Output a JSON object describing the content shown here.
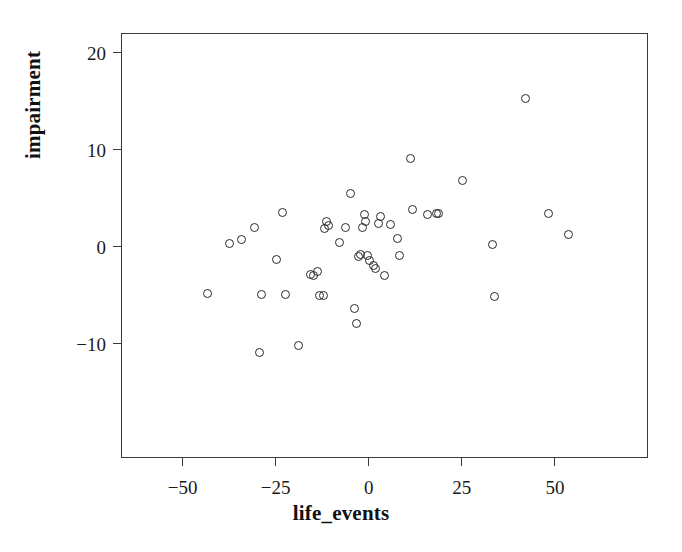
{
  "figure": {
    "background_color": "#ffffff",
    "frame_color": "#3a3a3a",
    "point_color": "#2a2a2a"
  },
  "chart_data": {
    "type": "scatter",
    "title": "",
    "xlabel": "life_events",
    "ylabel": "impairment",
    "xlim": [
      -66,
      75
    ],
    "ylim": [
      -21.7,
      21.8
    ],
    "xticks": [
      -50,
      -25,
      0,
      25,
      50
    ],
    "xtick_labels": [
      "−50",
      "−25",
      "0",
      "25",
      "50"
    ],
    "yticks": [
      -10,
      0,
      10,
      20
    ],
    "ytick_labels": [
      "−10",
      "0",
      "10",
      "20"
    ],
    "grid": false,
    "legend": null,
    "marker": "open-circle",
    "n_points": 48,
    "x": [
      -43.0,
      -37.0,
      -34.0,
      -30.5,
      -29.0,
      -28.5,
      -24.5,
      -23.0,
      -22.0,
      -18.5,
      -15.5,
      -14.5,
      -13.5,
      -13.0,
      -12.0,
      -11.5,
      -11.0,
      -10.5,
      -7.5,
      -6.0,
      -4.5,
      -3.5,
      -3.0,
      -2.5,
      -2.0,
      -1.5,
      -1.0,
      -0.5,
      0.0,
      0.5,
      1.5,
      2.0,
      3.0,
      3.5,
      4.5,
      6.0,
      8.0,
      8.5,
      11.5,
      12.0,
      16.0,
      18.5,
      19.0,
      25.5,
      33.5,
      34.0,
      48.5,
      42.5,
      54.0
    ],
    "y": [
      -4.9,
      0.3,
      0.7,
      1.9,
      -11.0,
      -5.0,
      -1.4,
      3.4,
      -5.0,
      -10.2,
      -2.9,
      -3.0,
      -2.6,
      -5.1,
      -5.1,
      1.8,
      2.5,
      2.1,
      0.4,
      1.9,
      5.4,
      -6.4,
      -8.0,
      -1.1,
      -0.9,
      1.9,
      3.2,
      2.5,
      -1.0,
      -1.5,
      -2.0,
      -2.3,
      2.3,
      3.0,
      -3.0,
      2.2,
      0.8,
      -1.0,
      9.0,
      3.8,
      3.2,
      3.3,
      3.3,
      6.7,
      0.2,
      -5.2,
      3.3,
      15.2,
      1.2
    ]
  },
  "axes": {
    "x_title": "life_events",
    "y_title": "impairment"
  }
}
